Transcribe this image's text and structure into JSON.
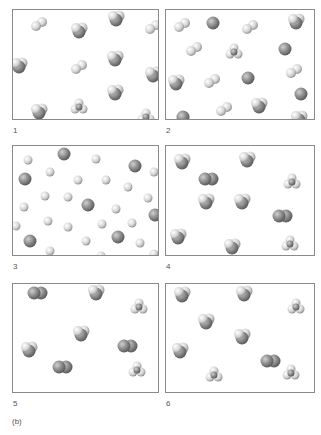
{
  "figure": {
    "caption": "(b)",
    "panels": [
      {
        "label": "1",
        "x": 12,
        "y": 9,
        "w": 147,
        "h": 111,
        "molecules": [
          {
            "type": "diatomic-light",
            "x": 18,
            "y": 7
          },
          {
            "type": "tri-light",
            "x": 58,
            "y": 12
          },
          {
            "type": "tri-light",
            "x": 95,
            "y": 0
          },
          {
            "type": "diatomic-light",
            "x": 132,
            "y": 10
          },
          {
            "type": "tri-light",
            "x": -2,
            "y": 47
          },
          {
            "type": "diatomic-light",
            "x": 58,
            "y": 50
          },
          {
            "type": "tri-light",
            "x": 94,
            "y": 40
          },
          {
            "type": "tri-light",
            "x": 132,
            "y": 56
          },
          {
            "type": "tri-light",
            "x": 94,
            "y": 74
          },
          {
            "type": "tetra-light",
            "x": 58,
            "y": 88
          },
          {
            "type": "tri-light",
            "x": 18,
            "y": 93
          },
          {
            "type": "tetra-light",
            "x": 125,
            "y": 98
          }
        ]
      },
      {
        "label": "2",
        "x": 165,
        "y": 9,
        "w": 150,
        "h": 111,
        "molecules": [
          {
            "type": "diatomic-light",
            "x": 8,
            "y": 8
          },
          {
            "type": "atom-dark",
            "x": 40,
            "y": 6
          },
          {
            "type": "diatomic-light",
            "x": 76,
            "y": 10
          },
          {
            "type": "tri-light",
            "x": 122,
            "y": 3
          },
          {
            "type": "diatomic-light",
            "x": 20,
            "y": 32
          },
          {
            "type": "tetra-light",
            "x": 60,
            "y": 33
          },
          {
            "type": "atom-dark",
            "x": 112,
            "y": 32
          },
          {
            "type": "diatomic-light",
            "x": 120,
            "y": 54
          },
          {
            "type": "tri-light",
            "x": 2,
            "y": 64
          },
          {
            "type": "diatomic-light",
            "x": 38,
            "y": 64
          },
          {
            "type": "atom-dark",
            "x": 75,
            "y": 61
          },
          {
            "type": "atom-dark",
            "x": 128,
            "y": 77
          },
          {
            "type": "diatomic-light",
            "x": 50,
            "y": 92
          },
          {
            "type": "tri-light",
            "x": 85,
            "y": 87
          },
          {
            "type": "atom-dark",
            "x": 10,
            "y": 100
          },
          {
            "type": "tri-light",
            "x": 125,
            "y": 100
          }
        ]
      },
      {
        "label": "3",
        "x": 12,
        "y": 145,
        "w": 147,
        "h": 111,
        "molecules": [
          {
            "type": "atom-small",
            "x": 10,
            "y": 9
          },
          {
            "type": "atom-dark",
            "x": 44,
            "y": 1
          },
          {
            "type": "atom-small",
            "x": 78,
            "y": 8
          },
          {
            "type": "atom-dark",
            "x": 115,
            "y": 13
          },
          {
            "type": "atom-small",
            "x": 136,
            "y": 21
          },
          {
            "type": "atom-dark",
            "x": 5,
            "y": 26
          },
          {
            "type": "atom-small",
            "x": 32,
            "y": 21
          },
          {
            "type": "atom-small",
            "x": 60,
            "y": 29
          },
          {
            "type": "atom-small",
            "x": 88,
            "y": 29
          },
          {
            "type": "atom-small",
            "x": 110,
            "y": 36
          },
          {
            "type": "atom-small",
            "x": 27,
            "y": 45
          },
          {
            "type": "atom-small",
            "x": 50,
            "y": 46
          },
          {
            "type": "atom-dark",
            "x": 68,
            "y": 52
          },
          {
            "type": "atom-small",
            "x": 130,
            "y": 47
          },
          {
            "type": "atom-small",
            "x": 6,
            "y": 56
          },
          {
            "type": "atom-small",
            "x": 98,
            "y": 58
          },
          {
            "type": "atom-dark",
            "x": 135,
            "y": 62
          },
          {
            "type": "atom-small",
            "x": 30,
            "y": 70
          },
          {
            "type": "atom-small",
            "x": -2,
            "y": 75
          },
          {
            "type": "atom-small",
            "x": 50,
            "y": 76
          },
          {
            "type": "atom-small",
            "x": 84,
            "y": 73
          },
          {
            "type": "atom-small",
            "x": 114,
            "y": 72
          },
          {
            "type": "atom-dark",
            "x": 10,
            "y": 88
          },
          {
            "type": "atom-small",
            "x": 68,
            "y": 90
          },
          {
            "type": "atom-dark",
            "x": 98,
            "y": 84
          },
          {
            "type": "atom-small",
            "x": 122,
            "y": 92
          },
          {
            "type": "atom-small",
            "x": 32,
            "y": 100
          },
          {
            "type": "atom-small",
            "x": 83,
            "y": 105
          },
          {
            "type": "atom-small",
            "x": 136,
            "y": 103
          }
        ]
      },
      {
        "label": "4",
        "x": 165,
        "y": 145,
        "w": 150,
        "h": 111,
        "molecules": [
          {
            "type": "tri-light",
            "x": 8,
            "y": 7
          },
          {
            "type": "diatomic-dark",
            "x": 33,
            "y": 26
          },
          {
            "type": "tri-light",
            "x": 73,
            "y": 5
          },
          {
            "type": "tetra-light",
            "x": 118,
            "y": 27
          },
          {
            "type": "tri-light",
            "x": 32,
            "y": 47
          },
          {
            "type": "tri-light",
            "x": 68,
            "y": 47
          },
          {
            "type": "diatomic-dark",
            "x": 107,
            "y": 63
          },
          {
            "type": "tri-light",
            "x": 4,
            "y": 82
          },
          {
            "type": "tri-light",
            "x": 58,
            "y": 92
          },
          {
            "type": "tetra-light",
            "x": 116,
            "y": 89
          }
        ]
      },
      {
        "label": "5",
        "x": 12,
        "y": 283,
        "w": 147,
        "h": 110,
        "molecules": [
          {
            "type": "diatomic-dark",
            "x": 15,
            "y": 2
          },
          {
            "type": "tri-light",
            "x": 75,
            "y": 0
          },
          {
            "type": "tetra-light",
            "x": 118,
            "y": 14
          },
          {
            "type": "tri-light",
            "x": 60,
            "y": 41
          },
          {
            "type": "tri-light",
            "x": 8,
            "y": 57
          },
          {
            "type": "diatomic-dark",
            "x": 105,
            "y": 55
          },
          {
            "type": "diatomic-dark",
            "x": 40,
            "y": 76
          },
          {
            "type": "tetra-light",
            "x": 116,
            "y": 77
          }
        ]
      },
      {
        "label": "6",
        "x": 165,
        "y": 283,
        "w": 150,
        "h": 110,
        "molecules": [
          {
            "type": "tri-light",
            "x": 8,
            "y": 2
          },
          {
            "type": "tri-light",
            "x": 70,
            "y": 1
          },
          {
            "type": "tetra-light",
            "x": 122,
            "y": 14
          },
          {
            "type": "tri-light",
            "x": 32,
            "y": 29
          },
          {
            "type": "tri-light",
            "x": 68,
            "y": 44
          },
          {
            "type": "tri-light",
            "x": 6,
            "y": 58
          },
          {
            "type": "diatomic-dark",
            "x": 95,
            "y": 70
          },
          {
            "type": "tetra-light",
            "x": 40,
            "y": 82
          },
          {
            "type": "tetra-light",
            "x": 117,
            "y": 80
          }
        ]
      }
    ]
  },
  "colors": {
    "border": "#8a8a8a",
    "light": "#e6e6e6",
    "dark": "#8c8c8c",
    "text": "#555555"
  }
}
